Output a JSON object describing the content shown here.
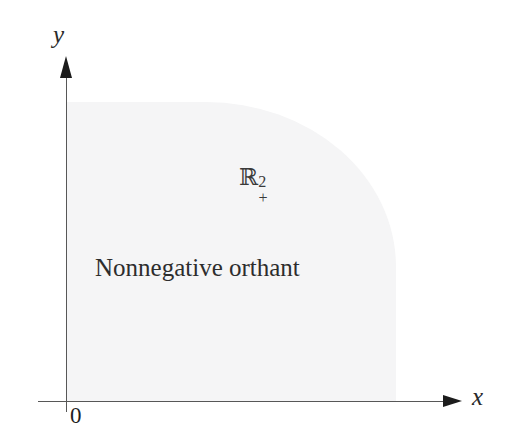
{
  "figure": {
    "kind": "math-diagram",
    "width": 510,
    "height": 442,
    "background_color": "#ffffff"
  },
  "axes": {
    "x_label": "x",
    "y_label": "y",
    "origin_label": "0",
    "axis_color": "#575757",
    "arrow_color": "#1c1c1c"
  },
  "region": {
    "symbol_base": "ℝ",
    "symbol_superscript": "2",
    "symbol_subscript": "+",
    "caption": "Nonnegative orthant",
    "fill_color": "#f5f5f6",
    "text_color": "#2d2d2d"
  },
  "chart_data": {
    "type": "area",
    "title": "",
    "xlabel": "x",
    "ylabel": "y",
    "annotations": [
      {
        "text": "ℝ²₊",
        "role": "region-symbol"
      },
      {
        "text": "Nonnegative orthant",
        "role": "region-caption"
      },
      {
        "text": "0",
        "role": "origin"
      }
    ],
    "grid": false,
    "legend": "none",
    "region_description": "Shaded quadrant x >= 0, y >= 0 with rounded upper-right corner"
  }
}
